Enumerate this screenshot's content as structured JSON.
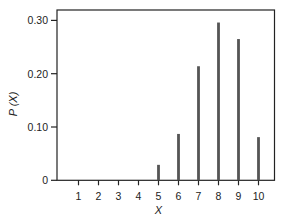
{
  "chart_data": {
    "type": "bar",
    "title": "",
    "xlabel": "X",
    "ylabel": "P (X)",
    "categories": [
      "1",
      "2",
      "3",
      "4",
      "5",
      "6",
      "7",
      "8",
      "9",
      "10"
    ],
    "values": [
      0,
      0,
      0,
      0,
      0.029,
      0.087,
      0.214,
      0.296,
      0.265,
      0.081
    ],
    "ylim": [
      0,
      0.33
    ],
    "yticks": [
      0,
      0.1,
      0.2,
      0.3
    ],
    "ytick_labels": [
      "0",
      "0.10",
      "0.20",
      "0.30"
    ],
    "xtick_labels": [
      "1",
      "2",
      "3",
      "4",
      "5",
      "6",
      "7",
      "8",
      "9",
      "10"
    ],
    "grid": false,
    "legend": null,
    "bar_style": "thin vertical lines (stem plot)",
    "bar_color": "#555555",
    "frame_color": "#222222"
  }
}
